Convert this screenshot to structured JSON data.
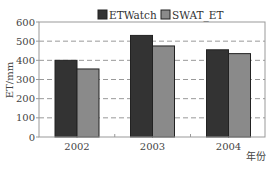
{
  "chart_data": {
    "type": "bar",
    "title": "",
    "xlabel": "年份",
    "ylabel": "ET/mm",
    "categories": [
      "2002",
      "2003",
      "2004"
    ],
    "series": [
      {
        "name": "ETWatch",
        "values": [
          400,
          530,
          455
        ],
        "color": "#333333"
      },
      {
        "name": "SWAT_ET",
        "values": [
          355,
          475,
          435
        ],
        "color": "#8a8a8a"
      }
    ],
    "ylim": [
      0,
      600
    ],
    "yticks": [
      0,
      100,
      200,
      300,
      400,
      500,
      600
    ],
    "grid": "horizontal dashed",
    "legend_position": "top"
  },
  "legend": [
    {
      "label": "ETWatch",
      "color": "#333333"
    },
    {
      "label": "SWAT_ET",
      "color": "#8a8a8a"
    }
  ],
  "axes": {
    "x_title": "年份",
    "y_title": "ET/mm"
  }
}
